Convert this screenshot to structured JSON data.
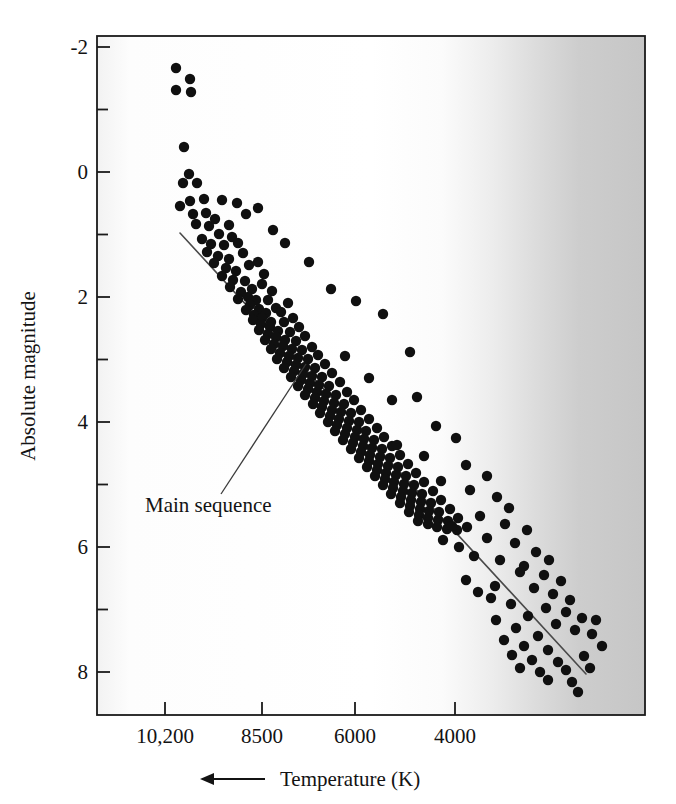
{
  "chart_data": {
    "type": "scatter",
    "title": "",
    "subtitle": "",
    "xlabel": "Temperature (K)",
    "ylabel": "Absolute magnitude",
    "xlabel_arrow": "←",
    "xlabel_arrow_meaning": "temperature increases to the left",
    "x_tick_labels": [
      "10,200",
      "8500",
      "6000",
      "4000"
    ],
    "x_tick_values": [
      10200,
      8500,
      6000,
      4000
    ],
    "x_tick_pixel_x": [
      165,
      262,
      355,
      455
    ],
    "x_axis_reversed": true,
    "xlim_pixels": [
      97,
      645
    ],
    "y_tick_labels": [
      "-2",
      "0",
      "2",
      "4",
      "6",
      "8"
    ],
    "y_tick_values": [
      -2,
      0,
      2,
      4,
      6,
      8
    ],
    "y_minor_tick_values": [
      -1,
      1,
      3,
      5,
      7
    ],
    "ylim": [
      -2.6,
      8.9
    ],
    "y_axis_inverted": true,
    "grid": false,
    "legend": "none",
    "annotations": [
      {
        "text": "Main sequence",
        "text_x": 145,
        "text_y": 512,
        "leader_from": [
          221,
          494
        ],
        "leader_to": [
          306,
          364
        ]
      }
    ],
    "fit_line": {
      "name": "Main sequence",
      "from_pixel": [
        180,
        233
      ],
      "to_pixel": [
        586,
        674
      ],
      "color": "#4a4a4a",
      "width": 1.6
    },
    "background": {
      "type": "horizontal-gradient",
      "description": "white on the hot (left) side fading to gray on the cool (right) side",
      "stops": [
        {
          "pos": 0.0,
          "color": "#f2f2f2"
        },
        {
          "pos": 0.06,
          "color": "#fdfdfd"
        },
        {
          "pos": 0.5,
          "color": "#ffffff"
        },
        {
          "pos": 0.63,
          "color": "#fbfbfb"
        },
        {
          "pos": 0.72,
          "color": "#ededed"
        },
        {
          "pos": 0.8,
          "color": "#dcdcdc"
        },
        {
          "pos": 0.88,
          "color": "#cdcdcd"
        },
        {
          "pos": 1.0,
          "color": "#c6c6c6"
        }
      ]
    },
    "point_style": {
      "color": "#101010",
      "radius": 5.2,
      "shape": "circle"
    },
    "point_count": 196,
    "points_pixels": [
      [
        176,
        68
      ],
      [
        190,
        79
      ],
      [
        176,
        90
      ],
      [
        191,
        92
      ],
      [
        184,
        147
      ],
      [
        189,
        174
      ],
      [
        183,
        183
      ],
      [
        197,
        183
      ],
      [
        190,
        201
      ],
      [
        204,
        199
      ],
      [
        180,
        206
      ],
      [
        193,
        214
      ],
      [
        206,
        213
      ],
      [
        222,
        200
      ],
      [
        237,
        203
      ],
      [
        246,
        214
      ],
      [
        196,
        224
      ],
      [
        209,
        226
      ],
      [
        215,
        219
      ],
      [
        219,
        234
      ],
      [
        229,
        225
      ],
      [
        232,
        237
      ],
      [
        202,
        239
      ],
      [
        211,
        244
      ],
      [
        224,
        245
      ],
      [
        238,
        243
      ],
      [
        207,
        252
      ],
      [
        218,
        256
      ],
      [
        229,
        259
      ],
      [
        243,
        253
      ],
      [
        249,
        265
      ],
      [
        214,
        263
      ],
      [
        226,
        268
      ],
      [
        236,
        271
      ],
      [
        258,
        262
      ],
      [
        264,
        274
      ],
      [
        222,
        276
      ],
      [
        233,
        280
      ],
      [
        245,
        281
      ],
      [
        252,
        289
      ],
      [
        262,
        284
      ],
      [
        272,
        291
      ],
      [
        230,
        287
      ],
      [
        241,
        292
      ],
      [
        248,
        297
      ],
      [
        256,
        300
      ],
      [
        268,
        300
      ],
      [
        276,
        308
      ],
      [
        238,
        299
      ],
      [
        250,
        305
      ],
      [
        259,
        309
      ],
      [
        266,
        313
      ],
      [
        281,
        312
      ],
      [
        288,
        303
      ],
      [
        246,
        310
      ],
      [
        254,
        315
      ],
      [
        262,
        318
      ],
      [
        271,
        322
      ],
      [
        284,
        322
      ],
      [
        293,
        318
      ],
      [
        253,
        320
      ],
      [
        261,
        324
      ],
      [
        270,
        327
      ],
      [
        278,
        331
      ],
      [
        290,
        332
      ],
      [
        299,
        327
      ],
      [
        259,
        330
      ],
      [
        268,
        334
      ],
      [
        276,
        337
      ],
      [
        285,
        340
      ],
      [
        296,
        341
      ],
      [
        305,
        336
      ],
      [
        265,
        340
      ],
      [
        274,
        344
      ],
      [
        283,
        346
      ],
      [
        292,
        349
      ],
      [
        302,
        350
      ],
      [
        312,
        347
      ],
      [
        271,
        349
      ],
      [
        280,
        353
      ],
      [
        289,
        356
      ],
      [
        298,
        358
      ],
      [
        308,
        359
      ],
      [
        318,
        355
      ],
      [
        277,
        359
      ],
      [
        287,
        362
      ],
      [
        296,
        365
      ],
      [
        305,
        367
      ],
      [
        315,
        368
      ],
      [
        325,
        364
      ],
      [
        284,
        368
      ],
      [
        294,
        371
      ],
      [
        303,
        374
      ],
      [
        312,
        376
      ],
      [
        322,
        377
      ],
      [
        332,
        373
      ],
      [
        291,
        377
      ],
      [
        301,
        380
      ],
      [
        310,
        383
      ],
      [
        319,
        385
      ],
      [
        329,
        386
      ],
      [
        340,
        382
      ],
      [
        298,
        386
      ],
      [
        308,
        389
      ],
      [
        317,
        392
      ],
      [
        326,
        394
      ],
      [
        336,
        395
      ],
      [
        347,
        392
      ],
      [
        305,
        395
      ],
      [
        315,
        398
      ],
      [
        324,
        401
      ],
      [
        334,
        403
      ],
      [
        344,
        404
      ],
      [
        354,
        400
      ],
      [
        313,
        404
      ],
      [
        322,
        407
      ],
      [
        332,
        410
      ],
      [
        341,
        412
      ],
      [
        351,
        413
      ],
      [
        361,
        410
      ],
      [
        320,
        413
      ],
      [
        330,
        416
      ],
      [
        339,
        419
      ],
      [
        349,
        421
      ],
      [
        359,
        422
      ],
      [
        369,
        419
      ],
      [
        328,
        422
      ],
      [
        337,
        425
      ],
      [
        347,
        428
      ],
      [
        357,
        430
      ],
      [
        366,
        431
      ],
      [
        377,
        428
      ],
      [
        335,
        431
      ],
      [
        345,
        434
      ],
      [
        355,
        437
      ],
      [
        364,
        439
      ],
      [
        374,
        440
      ],
      [
        384,
        437
      ],
      [
        343,
        440
      ],
      [
        353,
        443
      ],
      [
        363,
        446
      ],
      [
        372,
        448
      ],
      [
        382,
        449
      ],
      [
        392,
        446
      ],
      [
        351,
        449
      ],
      [
        361,
        452
      ],
      [
        370,
        455
      ],
      [
        380,
        457
      ],
      [
        390,
        458
      ],
      [
        400,
        455
      ],
      [
        359,
        458
      ],
      [
        369,
        461
      ],
      [
        378,
        464
      ],
      [
        388,
        466
      ],
      [
        398,
        467
      ],
      [
        408,
        464
      ],
      [
        367,
        467
      ],
      [
        377,
        470
      ],
      [
        386,
        473
      ],
      [
        396,
        475
      ],
      [
        406,
        476
      ],
      [
        416,
        473
      ],
      [
        375,
        476
      ],
      [
        385,
        479
      ],
      [
        394,
        482
      ],
      [
        404,
        484
      ],
      [
        414,
        485
      ],
      [
        424,
        482
      ],
      [
        383,
        485
      ],
      [
        393,
        488
      ],
      [
        403,
        491
      ],
      [
        412,
        493
      ],
      [
        422,
        494
      ],
      [
        433,
        491
      ],
      [
        391,
        494
      ],
      [
        401,
        497
      ],
      [
        411,
        500
      ],
      [
        421,
        502
      ],
      [
        431,
        503
      ],
      [
        441,
        500
      ],
      [
        400,
        503
      ],
      [
        410,
        506
      ],
      [
        420,
        509
      ],
      [
        429,
        511
      ],
      [
        439,
        512
      ],
      [
        450,
        509
      ],
      [
        409,
        512
      ],
      [
        419,
        515
      ],
      [
        428,
        518
      ],
      [
        438,
        520
      ],
      [
        448,
        521
      ],
      [
        458,
        518
      ],
      [
        418,
        521
      ],
      [
        428,
        524
      ],
      [
        437,
        527
      ],
      [
        447,
        529
      ],
      [
        457,
        530
      ],
      [
        467,
        527
      ]
    ],
    "scatter_outliers_pixels": [
      [
        273,
        230
      ],
      [
        285,
        243
      ],
      [
        258,
        208
      ],
      [
        309,
        262
      ],
      [
        331,
        289
      ],
      [
        356,
        301
      ],
      [
        383,
        314
      ],
      [
        410,
        352
      ],
      [
        345,
        356
      ],
      [
        369,
        378
      ],
      [
        392,
        400
      ],
      [
        417,
        397
      ],
      [
        436,
        426
      ],
      [
        456,
        438
      ],
      [
        397,
        445
      ],
      [
        424,
        456
      ],
      [
        466,
        465
      ],
      [
        487,
        476
      ],
      [
        441,
        481
      ],
      [
        470,
        490
      ],
      [
        497,
        497
      ],
      [
        509,
        508
      ],
      [
        480,
        516
      ],
      [
        505,
        524
      ],
      [
        527,
        530
      ],
      [
        515,
        543
      ],
      [
        536,
        552
      ],
      [
        549,
        560
      ],
      [
        524,
        566
      ],
      [
        544,
        575
      ],
      [
        561,
        581
      ],
      [
        534,
        588
      ],
      [
        553,
        594
      ],
      [
        570,
        600
      ],
      [
        546,
        608
      ],
      [
        566,
        612
      ],
      [
        582,
        618
      ],
      [
        556,
        624
      ],
      [
        575,
        630
      ],
      [
        592,
        634
      ],
      [
        500,
        560
      ],
      [
        520,
        572
      ],
      [
        491,
        598
      ],
      [
        511,
        604
      ],
      [
        528,
        616
      ],
      [
        496,
        620
      ],
      [
        516,
        628
      ],
      [
        538,
        636
      ],
      [
        504,
        640
      ],
      [
        524,
        646
      ],
      [
        548,
        650
      ],
      [
        512,
        655
      ],
      [
        532,
        660
      ],
      [
        558,
        662
      ],
      [
        520,
        668
      ],
      [
        540,
        672
      ],
      [
        566,
        670
      ],
      [
        548,
        680
      ],
      [
        572,
        682
      ],
      [
        584,
        656
      ],
      [
        596,
        620
      ],
      [
        602,
        646
      ],
      [
        590,
        668
      ],
      [
        578,
        692
      ],
      [
        459,
        547
      ],
      [
        474,
        556
      ],
      [
        487,
        538
      ],
      [
        466,
        580
      ],
      [
        452,
        526
      ],
      [
        443,
        540
      ],
      [
        478,
        592
      ],
      [
        495,
        586
      ]
    ]
  },
  "figure": {
    "frame": {
      "left": 97,
      "top": 36,
      "right": 645,
      "bottom": 715,
      "border_color": "#1a1a1a",
      "border_width": 1.8
    }
  }
}
